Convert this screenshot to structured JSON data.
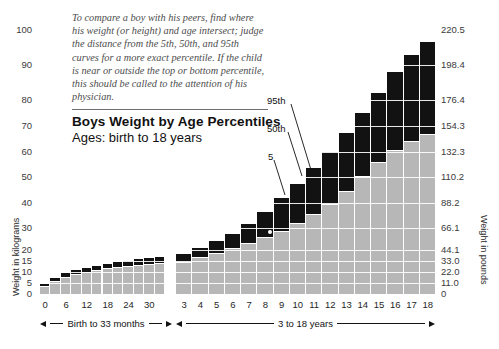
{
  "title": {
    "main": "Boys Weight by Age Percentiles",
    "sub": "Ages: birth to 18 years"
  },
  "blurb": "To compare a boy with his peers, find where his weight (or height) and age intersect; judge the distance from the 5th, 50th, and 95th curves for a more exact percentile. If the child is near or outside the top or bottom percentile, this should be called to the attention of his physician.",
  "axes": {
    "left_title": "Weight in kilograms",
    "right_title": "Weight in pounds",
    "left_ticks": [
      "100",
      "90",
      "80",
      "70",
      "60",
      "50",
      "40",
      "30",
      "20",
      "15",
      "10",
      "5",
      "0"
    ],
    "right_ticks": [
      "220.5",
      "198.4",
      "176.4",
      "154.3",
      "132.3",
      "110.2",
      "88.2",
      "66.1",
      "44.1",
      "33.0",
      "22.0",
      "11.0",
      "0"
    ],
    "months_ticks": [
      "0",
      "6",
      "12",
      "18",
      "24",
      "30"
    ],
    "years_ticks": [
      "3",
      "4",
      "5",
      "6",
      "7",
      "8",
      "9",
      "10",
      "11",
      "12",
      "13",
      "14",
      "15",
      "16",
      "17",
      "18"
    ],
    "months_range_label": "Birth to 33 months",
    "years_range_label": "3 to 18 years"
  },
  "callouts": [
    {
      "label": "95th"
    },
    {
      "label": "50th"
    },
    {
      "label": "5"
    }
  ],
  "colors": {
    "band_low": "#b7b7b7",
    "band_high": "#121212",
    "grid": "#ffffff",
    "text": "#111111",
    "blurb_text": "#4d4d4d"
  },
  "chart_data": {
    "type": "bar",
    "title": "Boys Weight by Age Percentiles",
    "subtitle": "Ages: birth to 18 years",
    "xlabel": "Age (Birth to 33 months; 3 to 18 years)",
    "ylabel": "Weight in kilograms",
    "y2label": "Weight in pounds",
    "ylim": [
      0,
      100
    ],
    "y2lim": [
      0,
      220.5
    ],
    "yticks": [
      0,
      5,
      10,
      15,
      20,
      30,
      40,
      50,
      60,
      70,
      80,
      90,
      100
    ],
    "y2ticks": [
      0,
      11.0,
      22.0,
      33.0,
      44.1,
      66.1,
      88.2,
      110.2,
      132.3,
      154.3,
      176.4,
      198.4,
      220.5
    ],
    "grid": true,
    "legend": [
      "5th percentile",
      "50th percentile",
      "95th percentile"
    ],
    "panels": [
      {
        "name": "Birth to 33 months",
        "x_unit": "months",
        "categories": [
          0,
          3,
          6,
          9,
          12,
          15,
          18,
          21,
          24,
          27,
          30,
          33
        ],
        "series": [
          {
            "name": "5th percentile",
            "values": [
              2.5,
              4.4,
              6.2,
              7.5,
              8.4,
              9.2,
              9.8,
              10.3,
              10.8,
              11.3,
              11.7,
              12.1
            ]
          },
          {
            "name": "50th percentile",
            "values": [
              3.5,
              6.0,
              7.9,
              9.2,
              10.2,
              11.0,
              11.7,
              12.2,
              12.7,
              13.2,
              13.7,
              14.2
            ]
          },
          {
            "name": "95th percentile",
            "values": [
              4.4,
              7.4,
              9.5,
              11.0,
              12.0,
              12.9,
              13.7,
              14.4,
              15.0,
              15.7,
              16.3,
              16.9
            ]
          }
        ]
      },
      {
        "name": "3 to 18 years",
        "x_unit": "years",
        "categories": [
          3,
          4,
          5,
          6,
          7,
          8,
          9,
          10,
          11,
          12,
          13,
          14,
          15,
          16,
          17,
          18
        ],
        "series": [
          {
            "name": "5th percentile",
            "values": [
              12.1,
              13.6,
              15.3,
              17.0,
              18.9,
              21.0,
              23.1,
              25.3,
              27.8,
              30.7,
              34.0,
              38.2,
              43.1,
              47.7,
              51.3,
              53.7
            ]
          },
          {
            "name": "50th percentile",
            "values": [
              14.6,
              16.7,
              18.7,
              20.7,
              23.0,
              25.8,
              28.8,
              32.0,
              35.5,
              39.8,
              44.8,
              50.4,
              56.0,
              60.8,
              64.4,
              67.0
            ]
          },
          {
            "name": "95th percentile",
            "values": [
              18.0,
              20.9,
              24.0,
              27.5,
              31.5,
              36.5,
              42.0,
              47.5,
              53.5,
              60.0,
              67.5,
              75.0,
              82.0,
              88.0,
              93.0,
              96.5
            ]
          }
        ]
      }
    ]
  }
}
